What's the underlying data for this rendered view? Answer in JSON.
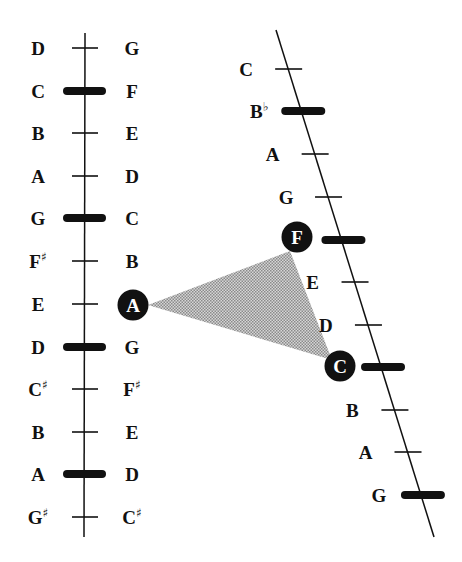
{
  "diagram": {
    "left_scale": {
      "line": {
        "x": 85,
        "y1": 33,
        "y2": 537
      },
      "rows": [
        {
          "y": 48,
          "left": "D",
          "left_acc": "",
          "right": "G",
          "right_acc": "",
          "bar": false
        },
        {
          "y": 91,
          "left": "C",
          "left_acc": "",
          "right": "F",
          "right_acc": "",
          "bar": true
        },
        {
          "y": 133,
          "left": "B",
          "left_acc": "",
          "right": "E",
          "right_acc": "",
          "bar": false
        },
        {
          "y": 176,
          "left": "A",
          "left_acc": "",
          "right": "D",
          "right_acc": "",
          "bar": false
        },
        {
          "y": 218,
          "left": "G",
          "left_acc": "",
          "right": "C",
          "right_acc": "",
          "bar": true
        },
        {
          "y": 261,
          "left": "F",
          "left_acc": "♯",
          "right": "B",
          "right_acc": "",
          "bar": false
        },
        {
          "y": 304,
          "left": "E",
          "left_acc": "",
          "right": "A",
          "right_acc": "",
          "bar": false,
          "right_highlight": true
        },
        {
          "y": 347,
          "left": "D",
          "left_acc": "",
          "right": "G",
          "right_acc": "",
          "bar": true
        },
        {
          "y": 389,
          "left": "C",
          "left_acc": "♯",
          "right": "F",
          "right_acc": "♯",
          "bar": false
        },
        {
          "y": 432,
          "left": "B",
          "left_acc": "",
          "right": "E",
          "right_acc": "",
          "bar": false
        },
        {
          "y": 474,
          "left": "A",
          "left_acc": "",
          "right": "D",
          "right_acc": "",
          "bar": true
        },
        {
          "y": 517,
          "left": "G",
          "left_acc": "♯",
          "right": "C",
          "right_acc": "♯",
          "bar": false
        }
      ]
    },
    "right_scale": {
      "line": {
        "x1": 276,
        "y1": 30,
        "x2": 434,
        "y2": 537
      },
      "rows": [
        {
          "y": 69,
          "label": "C",
          "acc": "",
          "bar": false
        },
        {
          "y": 111,
          "label": "B",
          "acc": "♭",
          "bar": true
        },
        {
          "y": 154,
          "label": "A",
          "acc": "",
          "bar": false
        },
        {
          "y": 197,
          "label": "G",
          "acc": "",
          "bar": false
        },
        {
          "y": 240,
          "label": "F",
          "acc": "",
          "bar": true,
          "highlight": true
        },
        {
          "y": 282,
          "label": "E",
          "acc": "",
          "bar": false
        },
        {
          "y": 325,
          "label": "D",
          "acc": "",
          "bar": false
        },
        {
          "y": 367,
          "label": "C",
          "acc": "",
          "bar": true,
          "highlight": true
        },
        {
          "y": 410,
          "label": "B",
          "acc": "",
          "bar": false
        },
        {
          "y": 452,
          "label": "A",
          "acc": "",
          "bar": false
        },
        {
          "y": 495,
          "label": "G",
          "acc": "",
          "bar": false,
          "bar_wide": true
        }
      ]
    },
    "triangle": {
      "vertices": [
        "A",
        "F",
        "C"
      ],
      "fill": "#b8b8b8"
    },
    "colors": {
      "ink": "#111111",
      "background": "#ffffff",
      "shade": "#b8b8b8"
    }
  }
}
